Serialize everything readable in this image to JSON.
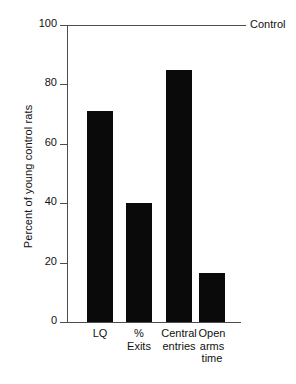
{
  "chart_data": {
    "type": "bar",
    "title": "",
    "xlabel": "",
    "ylabel": "Percent of young control rats",
    "ylim": [
      0,
      100
    ],
    "yticks": [
      0,
      20,
      40,
      60,
      80,
      100
    ],
    "ytick_labels": [
      "0",
      "20",
      "40",
      "60",
      "80",
      "100"
    ],
    "grid": false,
    "legend_position": "inline-right",
    "categories": [
      "LQ",
      "% Exits",
      "Central entries",
      "Open arms time"
    ],
    "category_label_lines": [
      [
        "LQ"
      ],
      [
        "%",
        "Exits"
      ],
      [
        "Central",
        "entries"
      ],
      [
        "Open",
        "arms",
        "time"
      ]
    ],
    "values": [
      71,
      40,
      85,
      16.5
    ],
    "bar_color": "#0a0a0a",
    "annotations": [
      {
        "name": "control-reference-line",
        "label": "Control",
        "value": 100,
        "color": "#4d4d4d"
      }
    ]
  }
}
